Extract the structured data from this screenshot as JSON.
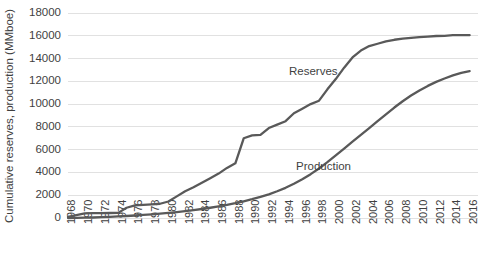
{
  "chart_data": {
    "type": "line",
    "title": "",
    "xlabel": "",
    "ylabel": "Cumulative reserves, production (MMboe)",
    "ylim": [
      0,
      18000
    ],
    "xlim": [
      1968,
      2017
    ],
    "grid": true,
    "legend_position": "inline-annotations",
    "y_ticks": [
      0,
      2000,
      4000,
      6000,
      8000,
      10000,
      12000,
      14000,
      16000,
      18000
    ],
    "y_tick_labels": [
      "0",
      "2000",
      "4000",
      "6000",
      "8000",
      "10000",
      "12000",
      "14000",
      "16000",
      "18000"
    ],
    "x_ticks": [
      1968,
      1970,
      1972,
      1974,
      1976,
      1978,
      1980,
      1982,
      1984,
      1986,
      1988,
      1990,
      1992,
      1994,
      1996,
      1998,
      2000,
      2002,
      2004,
      2006,
      2008,
      2010,
      2012,
      2014,
      2016
    ],
    "x_tick_labels": [
      "1968",
      "1970",
      "1972",
      "1974",
      "1976",
      "1978",
      "1980",
      "1982",
      "1984",
      "1986",
      "1988",
      "1990",
      "1992",
      "1994",
      "1996",
      "1998",
      "2000",
      "2002",
      "2004",
      "2006",
      "2008",
      "2010",
      "2012",
      "2014",
      "2016"
    ],
    "x": [
      1968,
      1969,
      1970,
      1971,
      1972,
      1973,
      1974,
      1975,
      1976,
      1977,
      1978,
      1979,
      1980,
      1981,
      1982,
      1983,
      1984,
      1985,
      1986,
      1987,
      1988,
      1989,
      1990,
      1991,
      1992,
      1993,
      1994,
      1995,
      1996,
      1997,
      1998,
      1999,
      2000,
      2001,
      2002,
      2003,
      2004,
      2005,
      2006,
      2007,
      2008,
      2009,
      2010,
      2011,
      2012,
      2013,
      2014,
      2015,
      2016
    ],
    "series": [
      {
        "name": "Reserves",
        "label": "Reserves",
        "color": "#595959",
        "values": [
          100,
          250,
          400,
          420,
          430,
          440,
          450,
          900,
          1100,
          1150,
          1200,
          1250,
          1450,
          1900,
          2350,
          2700,
          3100,
          3500,
          3900,
          4400,
          4800,
          7000,
          7250,
          7300,
          7900,
          8200,
          8500,
          9200,
          9600,
          10000,
          10300,
          11300,
          12200,
          13200,
          14100,
          14700,
          15100,
          15300,
          15500,
          15650,
          15750,
          15820,
          15880,
          15930,
          15980,
          16000,
          16050,
          16050,
          16050
        ]
      },
      {
        "name": "Production",
        "label": "Production",
        "color": "#595959",
        "values": [
          0,
          10,
          25,
          45,
          70,
          100,
          135,
          175,
          220,
          270,
          325,
          385,
          450,
          520,
          600,
          690,
          790,
          900,
          1020,
          1150,
          1300,
          1470,
          1650,
          1850,
          2080,
          2350,
          2650,
          3000,
          3400,
          3850,
          4350,
          4900,
          5500,
          6100,
          6700,
          7300,
          7900,
          8500,
          9100,
          9700,
          10250,
          10750,
          11200,
          11600,
          11950,
          12250,
          12520,
          12750,
          12900
        ]
      }
    ],
    "annotations": [
      {
        "name": "reserves-label",
        "text": "Reserves",
        "x_px": 289,
        "y_px": 72
      },
      {
        "name": "production-label",
        "text": "Production",
        "x_px": 296,
        "y_px": 167
      }
    ]
  }
}
